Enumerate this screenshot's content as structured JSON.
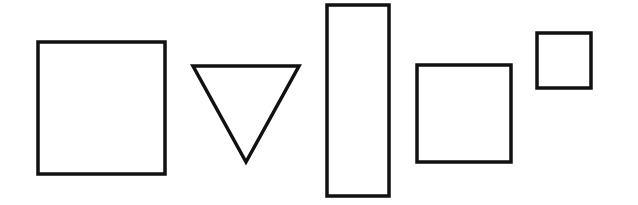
{
  "diagram": {
    "background": "#ffffff",
    "stroke_color": "#111111",
    "stroke_width": 3.5,
    "shapes": [
      {
        "id": "shape-1",
        "type": "square",
        "x": 38,
        "y": 42,
        "width": 127,
        "height": 132
      },
      {
        "id": "shape-2",
        "type": "triangle-down",
        "points": [
          [
            193,
            66
          ],
          [
            299,
            66
          ],
          [
            246,
            162
          ]
        ]
      },
      {
        "id": "shape-3",
        "type": "rectangle",
        "x": 327,
        "y": 5,
        "width": 62,
        "height": 191
      },
      {
        "id": "shape-4",
        "type": "square",
        "x": 417,
        "y": 65,
        "width": 94,
        "height": 97
      },
      {
        "id": "shape-5",
        "type": "square",
        "x": 537,
        "y": 33,
        "width": 54,
        "height": 55
      }
    ]
  }
}
